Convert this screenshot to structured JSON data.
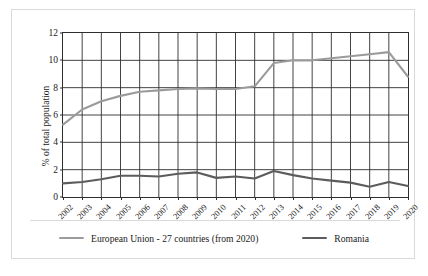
{
  "chart_data": {
    "type": "line",
    "title": "",
    "xlabel": "",
    "ylabel": "% of total population",
    "ylim": [
      0,
      12
    ],
    "yticks": [
      0,
      2,
      4,
      6,
      8,
      10,
      12
    ],
    "grid": true,
    "legend_position": "bottom",
    "categories": [
      "2002",
      "2003",
      "2004",
      "2005",
      "2006",
      "2007",
      "2008",
      "2009",
      "2010",
      "2011",
      "2012",
      "2013",
      "2014",
      "2015",
      "2016",
      "2017",
      "2018",
      "2019",
      "2020"
    ],
    "series": [
      {
        "name": "European Union - 27 countries (from 2020)",
        "color": "#9b9b9b",
        "values": [
          5.3,
          6.4,
          7.0,
          7.4,
          7.7,
          7.8,
          7.9,
          7.95,
          7.9,
          7.9,
          8.1,
          9.8,
          10.0,
          10.0,
          10.15,
          10.3,
          10.45,
          10.6,
          8.8
        ]
      },
      {
        "name": "Romania",
        "color": "#5c5c5c",
        "values": [
          1.0,
          1.1,
          1.3,
          1.55,
          1.55,
          1.5,
          1.7,
          1.8,
          1.4,
          1.5,
          1.35,
          1.9,
          1.6,
          1.35,
          1.2,
          1.05,
          0.75,
          1.1,
          0.8
        ]
      }
    ],
    "legend": [
      {
        "label": "European Union - 27 countries (from 2020)",
        "color": "#9b9b9b"
      },
      {
        "label": "Romania",
        "color": "#5c5c5c"
      }
    ]
  }
}
